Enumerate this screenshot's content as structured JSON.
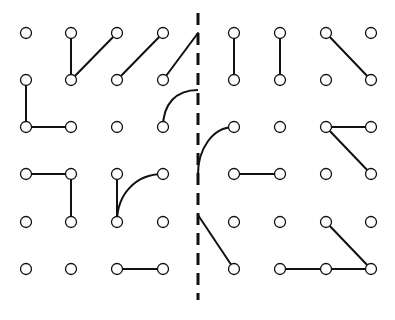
{
  "diagram": {
    "title": "",
    "colors": {
      "background": "#ffffff",
      "ink": "#111111"
    },
    "grid": {
      "left_columns_x": [
        26,
        71,
        117,
        163
      ],
      "right_columns_x": [
        234,
        280,
        326,
        371
      ],
      "rows_y": [
        33,
        80,
        127,
        174,
        222,
        269
      ],
      "dot_radius": 5.5
    },
    "mirror_line": {
      "x": 198,
      "y1": 13,
      "y2": 300,
      "dash": "12 8",
      "width": 3
    },
    "segments": [
      {
        "from": [
          71,
          33
        ],
        "to": [
          71,
          80
        ]
      },
      {
        "from": [
          71,
          80
        ],
        "to": [
          117,
          33
        ]
      },
      {
        "from": [
          117,
          80
        ],
        "to": [
          163,
          33
        ]
      },
      {
        "from": [
          163,
          80
        ],
        "to": [
          198,
          33
        ]
      },
      {
        "from": [
          26,
          80
        ],
        "to": [
          26,
          127
        ]
      },
      {
        "from": [
          26,
          127
        ],
        "to": [
          71,
          127
        ]
      },
      {
        "from": [
          26,
          174
        ],
        "to": [
          71,
          174
        ]
      },
      {
        "from": [
          71,
          174
        ],
        "to": [
          71,
          222
        ]
      },
      {
        "from": [
          117,
          174
        ],
        "to": [
          117,
          222
        ]
      },
      {
        "from": [
          117,
          269
        ],
        "to": [
          163,
          269
        ]
      },
      {
        "from": [
          234,
          33
        ],
        "to": [
          234,
          80
        ]
      },
      {
        "from": [
          280,
          33
        ],
        "to": [
          280,
          80
        ]
      },
      {
        "from": [
          326,
          33
        ],
        "to": [
          371,
          80
        ]
      },
      {
        "from": [
          326,
          127
        ],
        "to": [
          371,
          127
        ]
      },
      {
        "from": [
          326,
          127
        ],
        "to": [
          371,
          174
        ]
      },
      {
        "from": [
          234,
          174
        ],
        "to": [
          280,
          174
        ]
      },
      {
        "from": [
          198,
          215
        ],
        "to": [
          234,
          269
        ]
      },
      {
        "from": [
          326,
          222
        ],
        "to": [
          371,
          269
        ]
      },
      {
        "from": [
          280,
          269
        ],
        "to": [
          371,
          269
        ]
      }
    ],
    "arcs": [
      {
        "path": "M163,127 C163,105 175,90 198,90"
      },
      {
        "path": "M117,222 C117,195 135,174 163,174"
      },
      {
        "path": "M198,174 C198,150 212,127 234,127"
      }
    ]
  }
}
